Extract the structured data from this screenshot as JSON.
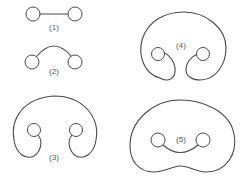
{
  "diagram": {
    "title": "",
    "stroke_color": "#4a4a4a",
    "figures": [
      {
        "id": "fig1",
        "label": "(1)",
        "description": "two circles joined by a straight line"
      },
      {
        "id": "fig2",
        "label": "(2)",
        "description": "two circles joined by an upward arc"
      },
      {
        "id": "fig3",
        "label": "(3)",
        "description": "two circles joined by a large open loop (horseshoe) with hooked ends"
      },
      {
        "id": "fig4",
        "label": "(4)",
        "description": "two circles joined by a large nearly closed loop with inward hooked ends"
      },
      {
        "id": "fig5",
        "label": "(5)",
        "description": "two circles joined by a lower arc, enclosed by a closed kidney-shaped loop"
      }
    ]
  }
}
